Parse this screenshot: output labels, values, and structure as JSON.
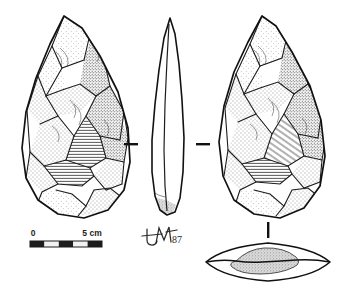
{
  "plate": {
    "kind": "archaeological-lithic-illustration",
    "subject": "bifacial handaxe",
    "technique": "stipple and hatch pen-and-ink line drawing",
    "background_color": "#ffffff",
    "ink_color": "#1d1d1d",
    "stipple_tone": "#6e6e6e",
    "cortex_tone": "#b0b0b0"
  },
  "views": [
    {
      "id": "view-left-face",
      "label": "",
      "position": "left",
      "description": "obverse face of bifacial handaxe, pointed ovate, flake scars with stipple shading"
    },
    {
      "id": "view-profile",
      "label": "",
      "position": "centre",
      "description": "lateral profile, narrow lenticular outline, sinuous edge"
    },
    {
      "id": "view-right-face",
      "label": "",
      "position": "right",
      "description": "reverse face of bifacial handaxe, flake scars with stipple shading"
    },
    {
      "id": "view-cross-section",
      "label": "",
      "position": "lower-right",
      "description": "transverse section, lenticular with central stippled cortex patch"
    }
  ],
  "section_markers": [
    {
      "id": "marker-left",
      "shape": "dash",
      "side": "left-of-profile"
    },
    {
      "id": "marker-right",
      "shape": "dash",
      "side": "right-of-profile"
    },
    {
      "id": "marker-section-tie",
      "shape": "vertical-tick",
      "links": "right-face-to-cross-section"
    }
  ],
  "scale_bar": {
    "start_label": "0",
    "end_label": "5 cm",
    "units": "cm",
    "total_length_cm": 5,
    "segments": 5,
    "segment_fill_pattern": [
      "dark",
      "light",
      "dark",
      "light",
      "dark"
    ],
    "dark_color": "#1d1d1d",
    "light_color": "#f2f2f2"
  },
  "signature": {
    "monogram": "JM",
    "year": "87",
    "full": "JM 87",
    "description": "handwritten artist monogram with date"
  }
}
